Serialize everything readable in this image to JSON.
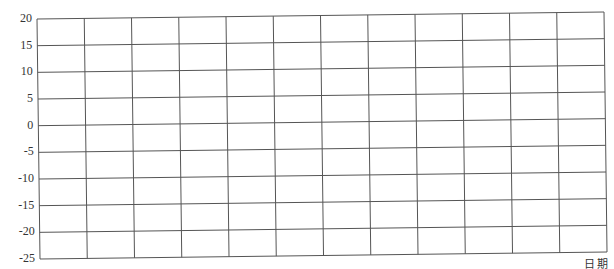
{
  "chart_data": {
    "type": "line",
    "title": "",
    "xlabel": "日期",
    "ylabel": "",
    "ylim": [
      -25,
      20
    ],
    "yticks": [
      20,
      15,
      10,
      5,
      0,
      -5,
      -10,
      -15,
      -20,
      -25
    ],
    "ytick_labels": [
      "20",
      "15",
      "10",
      "5",
      "0",
      "-5",
      "-10",
      "-15",
      "-20",
      "-25"
    ],
    "x_columns": 12,
    "categories": [],
    "series": [],
    "grid": true,
    "legend": "none",
    "note": "Blank grid worksheet, no data plotted"
  },
  "colors": {
    "grid": "#555555",
    "background": "#ffffff",
    "text": "#333333"
  }
}
